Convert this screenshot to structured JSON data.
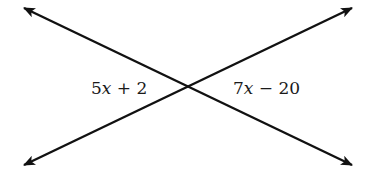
{
  "diagram": {
    "type": "intersecting-lines",
    "line_color": "#111111",
    "intersection": {
      "x": 188,
      "y": 87
    },
    "lines": [
      {
        "name": "line-descending",
        "from": {
          "x": 24,
          "y": 8
        },
        "to": {
          "x": 352,
          "y": 165
        },
        "arrows": "both"
      },
      {
        "name": "line-ascending",
        "from": {
          "x": 24,
          "y": 165
        },
        "to": {
          "x": 352,
          "y": 8
        },
        "arrows": "both"
      }
    ],
    "angles": [
      {
        "position": "left",
        "coef": "5",
        "var": "x",
        "op": " + ",
        "const": "2",
        "expression": "5x + 2"
      },
      {
        "position": "right",
        "coef": "7",
        "var": "x",
        "op": " − ",
        "const": "20",
        "expression": "7x − 20"
      }
    ]
  }
}
